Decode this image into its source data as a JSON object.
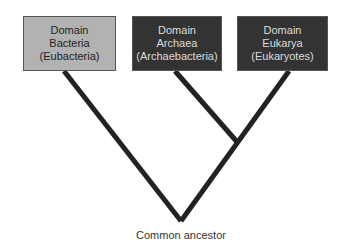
{
  "diagram": {
    "nodes": [
      {
        "id": "bacteria",
        "line1": "Domain",
        "line2": "Bacteria",
        "line3": "(Eubacteria)",
        "fill": "#b2b2b2"
      },
      {
        "id": "archaea",
        "line1": "Domain",
        "line2": "Archaea",
        "line3": "(Archaebacteria)",
        "fill": "#333333"
      },
      {
        "id": "eukarya",
        "line1": "Domain",
        "line2": "Eukarya",
        "line3": "(Eukaryotes)",
        "fill": "#333333"
      }
    ],
    "root_label": "Common ancestor",
    "line_color": "#222222"
  }
}
